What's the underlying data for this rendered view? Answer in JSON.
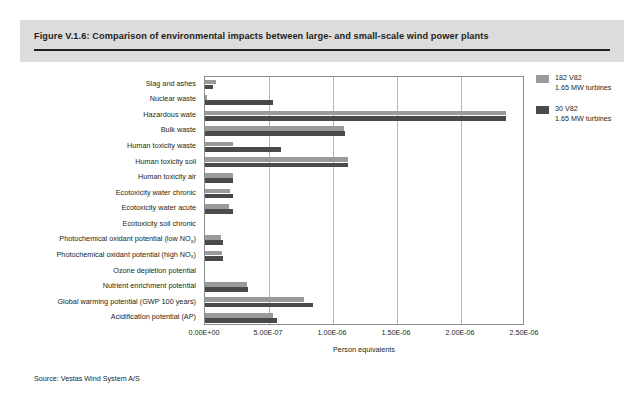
{
  "figure": {
    "title": "Figure V.1.6: Comparison of environmental impacts between large- and small-scale wind power plants",
    "source": "Source: Vestas Wind System A/S"
  },
  "legend": {
    "position": "right",
    "items": [
      {
        "label_line1": "182 V82",
        "label_line2": "1.65 MW turbines",
        "color": "#9a9a9a"
      },
      {
        "label_line1": "30 V82",
        "label_line2": "1.65 MW turbines",
        "color": "#4a4a4a"
      }
    ]
  },
  "chart_data": {
    "type": "bar",
    "orientation": "horizontal",
    "title": "Comparison of environmental impacts between large- and small-scale wind power plants",
    "xlabel": "Person equivalents",
    "ylabel": "",
    "xlim": [
      0,
      2.5e-06
    ],
    "xticks": [
      0,
      5e-07,
      1e-06,
      1.5e-06,
      2e-06,
      2.5e-06
    ],
    "xticklabels": [
      "0.00E+00",
      "5.00E-07",
      "1.00E-06",
      "1.50E-06",
      "2.00E-06",
      "2.50E-06"
    ],
    "grid": "vertical",
    "categories": [
      "Slag and ashes",
      "Nuclear waste",
      "Hazardous wate",
      "Bulk waste",
      "Human toxicity waste",
      "Human toxicity soil",
      "Human toxicity air",
      "Ecotoxicity water chronic",
      "Ecotoxicity water acute",
      "Ecotoxicity soil chronic",
      "Photochemical oxidant potential (low NOx)",
      "Photochemical oxidant potential (high NOx)",
      "Ozone depletion potential",
      "Nutrient enrichment potential",
      "Global warming potential (GWP 100 years)",
      "Acidification potential (AP)"
    ],
    "categories_html": [
      "Slag and ashes",
      "Nuclear waste",
      "Hazardous wate",
      "Bulk waste",
      "Human toxicity waste",
      "Human toxicity soil",
      "Human toxicity air",
      "Ecotoxicity water chronic",
      "Ecotoxicity water acute",
      "Ecotoxicity soil chronic",
      "Photochemical oxidant potential (low NO<sub>x</sub>)",
      "Photochemical oxidant potential (high NO<sub>x</sub>)",
      "Ozone depletion potential",
      "Nutrient enrichment potential",
      "Global warming potential (GWP 100 years)",
      "Acidification potential (AP)"
    ],
    "series": [
      {
        "name": "182 V82 1.65 MW turbines",
        "color": "#9a9a9a",
        "values": [
          8.6e-08,
          1.7e-08,
          2.35e-06,
          1.085e-06,
          2.2e-07,
          1.12e-06,
          2.15e-07,
          1.95e-07,
          1.9e-07,
          0.0,
          1.25e-07,
          1.3e-07,
          0.0,
          3.3e-07,
          7.75e-07,
          5.3e-07
        ]
      },
      {
        "name": "30 V82 1.65 MW turbines",
        "color": "#4a4a4a",
        "values": [
          6.3e-08,
          5.3e-07,
          2.35e-06,
          1.09e-06,
          5.95e-07,
          1.12e-06,
          2.2e-07,
          2.2e-07,
          2.2e-07,
          0.0,
          1.4e-07,
          1.4e-07,
          0.0,
          3.35e-07,
          8.4e-07,
          5.6e-07
        ]
      }
    ]
  }
}
